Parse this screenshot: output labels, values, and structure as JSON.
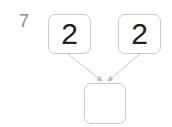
{
  "problem": {
    "number": "7",
    "left_value": "2",
    "right_value": "2",
    "answer_value": ""
  },
  "colors": {
    "border": "#c8c8c8",
    "arrow": "#bdbdbd",
    "number_text": "#222222",
    "label_text": "#8a8a8a"
  }
}
